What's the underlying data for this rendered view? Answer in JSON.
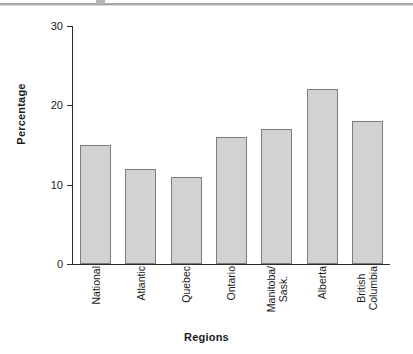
{
  "chart_data": {
    "type": "bar",
    "title": "",
    "xlabel": "Regions",
    "ylabel": "Percentage",
    "categories": [
      "National",
      "Atlantic",
      "Quebec",
      "Ontario",
      "Manitoba/ Sask.",
      "Alberta",
      "British Columbia"
    ],
    "category_lines": [
      [
        "National"
      ],
      [
        "Atlantic"
      ],
      [
        "Quebec"
      ],
      [
        "Ontario"
      ],
      [
        "Manitoba/",
        "Sask."
      ],
      [
        "Alberta"
      ],
      [
        "British",
        "Columbia"
      ]
    ],
    "values": [
      15,
      12,
      11,
      16,
      17,
      22,
      18
    ],
    "ylim": [
      0,
      30
    ],
    "yticks": [
      0,
      10,
      20,
      30
    ],
    "ytick_labels": [
      "0",
      "10",
      "20",
      "30"
    ],
    "grid": false,
    "legend": "none",
    "bar_fill": "#d2d2d2",
    "bar_edge": "#7d7d7d",
    "axis_color": "#2b2b2b",
    "background": "#ffffff"
  }
}
